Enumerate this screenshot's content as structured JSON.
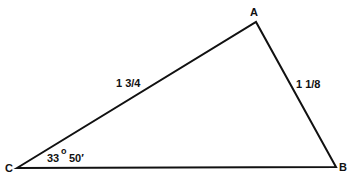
{
  "diagram": {
    "type": "triangle",
    "vertices": {
      "A": {
        "label": "A"
      },
      "B": {
        "label": "B"
      },
      "C": {
        "label": "C"
      }
    },
    "sides": {
      "CA": {
        "label": "1 3/4"
      },
      "AB": {
        "label": "1 1/8"
      }
    },
    "angle_C": {
      "degrees": "33",
      "degree_symbol": "o",
      "minutes": "50′"
    },
    "line_color": "#111111"
  }
}
